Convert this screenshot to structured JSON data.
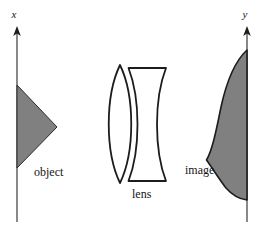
{
  "figure": {
    "width": 261,
    "height": 231,
    "background": "#ffffff",
    "stroke_color": "#141414",
    "fill_color": "#808080",
    "axis_color": "#6b6b6b"
  },
  "axes": {
    "left": {
      "name": "x",
      "label": "x",
      "label_x": 14,
      "label_y": 17,
      "line_x": 17,
      "line_top": 27,
      "line_bottom": 222,
      "arrow": "up"
    },
    "right": {
      "name": "y",
      "label": "y",
      "label_x": 244,
      "label_y": 17,
      "line_x": 247,
      "line_top": 27,
      "line_bottom": 222,
      "arrow": "up"
    }
  },
  "object": {
    "label": "object",
    "label_x": 34,
    "label_y": 176,
    "shape": "triangle",
    "fill": "#808080",
    "points": "17,85 57,127 17,168"
  },
  "lens": {
    "label": "lens",
    "label_x": 132,
    "label_y": 198,
    "elements": [
      {
        "name": "biconvex-element",
        "shape": "biconvex",
        "path": "M 120 65 C 134 95 134 152 120 183 C 106 152 106 95 120 65 Z"
      },
      {
        "name": "biconcave-element",
        "shape": "biconcave",
        "path": "M 128 68 L 166 68 C 155 98 155 151 166 181 L 128 181 C 140 151 140 98 128 68 Z"
      }
    ]
  },
  "image": {
    "label": "image",
    "label_x": 185,
    "label_y": 174,
    "shape": "s-curve-blob",
    "fill": "#808080",
    "path": "M 247 50 C 233 66 224 90 219 112 C 214 134 210 152 206 160 C 212 168 219 178 226 188 C 232 195 240 199 247 200 Z"
  }
}
